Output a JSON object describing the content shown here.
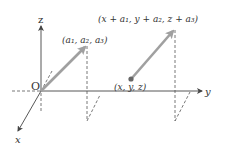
{
  "diagram": {
    "type": "3d-vector-translation",
    "axes": {
      "x_label": "x",
      "y_label": "y",
      "z_label": "z",
      "origin_label": "O"
    },
    "vectors": [
      {
        "name": "position-vector",
        "tail_label": "O",
        "head_label": "(a₁, a₂, a₃)"
      },
      {
        "name": "translated-vector",
        "tail_label": "(x, y, z)",
        "head_label": "(x + a₁, y + a₂, z + a₃)"
      }
    ],
    "colors": {
      "axis": "#444444",
      "vector": "#a0a0a0",
      "dashed": "#555555",
      "point": "#666666"
    }
  }
}
